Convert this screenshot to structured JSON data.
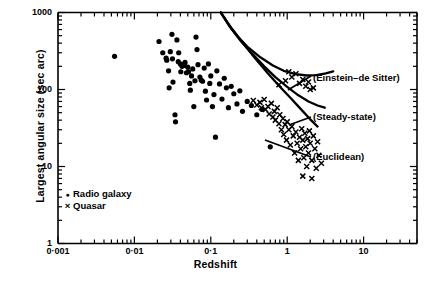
{
  "chart_data": {
    "type": "scatter",
    "title": "",
    "xlabel": "Redshift",
    "ylabel": "Largest angular size (sec arc)",
    "xscale": "log",
    "yscale": "log",
    "xlim": [
      0.001,
      50
    ],
    "ylim": [
      1,
      1000
    ],
    "grid": false,
    "xticklabels": [
      "0·001",
      "0·01",
      "0·1",
      "1",
      "10"
    ],
    "xtickvalues": [
      0.001,
      0.01,
      0.1,
      1,
      10
    ],
    "yticklabels": [
      "1000",
      "100",
      "10",
      "1"
    ],
    "ytickvalues": [
      1000,
      100,
      10,
      1
    ],
    "legend_position": "lower-left inside axes",
    "series": [
      {
        "name": "Radio galaxy",
        "marker": "filled-circle",
        "color": "#000000",
        "points": [
          [
            0.0055,
            270
          ],
          [
            0.021,
            420
          ],
          [
            0.0235,
            300
          ],
          [
            0.026,
            255
          ],
          [
            0.0265,
            240
          ],
          [
            0.028,
            175
          ],
          [
            0.0285,
            105
          ],
          [
            0.0295,
            310
          ],
          [
            0.031,
            520
          ],
          [
            0.0315,
            250
          ],
          [
            0.032,
            125
          ],
          [
            0.034,
            47
          ],
          [
            0.0345,
            38
          ],
          [
            0.036,
            440
          ],
          [
            0.0375,
            230
          ],
          [
            0.038,
            300
          ],
          [
            0.04,
            215
          ],
          [
            0.0405,
            170
          ],
          [
            0.042,
            200
          ],
          [
            0.044,
            210
          ],
          [
            0.045,
            205
          ],
          [
            0.046,
            225
          ],
          [
            0.048,
            165
          ],
          [
            0.05,
            195
          ],
          [
            0.051,
            170
          ],
          [
            0.053,
            120
          ],
          [
            0.054,
            98
          ],
          [
            0.056,
            150
          ],
          [
            0.058,
            185
          ],
          [
            0.06,
            60
          ],
          [
            0.062,
            130
          ],
          [
            0.064,
            480
          ],
          [
            0.066,
            330
          ],
          [
            0.068,
            210
          ],
          [
            0.072,
            145
          ],
          [
            0.075,
            132
          ],
          [
            0.078,
            128
          ],
          [
            0.082,
            190
          ],
          [
            0.085,
            95
          ],
          [
            0.088,
            73
          ],
          [
            0.093,
            215
          ],
          [
            0.097,
            120
          ],
          [
            0.1,
            150
          ],
          [
            0.105,
            60
          ],
          [
            0.11,
            86
          ],
          [
            0.115,
            24
          ],
          [
            0.12,
            175
          ],
          [
            0.13,
            118
          ],
          [
            0.14,
            75
          ],
          [
            0.15,
            140
          ],
          [
            0.16,
            105
          ],
          [
            0.17,
            58
          ],
          [
            0.185,
            110
          ],
          [
            0.2,
            88
          ],
          [
            0.22,
            65
          ],
          [
            0.24,
            96
          ],
          [
            0.26,
            52
          ],
          [
            0.3,
            70
          ],
          [
            0.34,
            62
          ],
          [
            0.4,
            47
          ],
          [
            0.47,
            55
          ],
          [
            0.6,
            18
          ]
        ]
      },
      {
        "name": "Quasar",
        "marker": "cross",
        "color": "#000000",
        "points": [
          [
            0.36,
            72
          ],
          [
            0.4,
            63
          ],
          [
            0.44,
            68
          ],
          [
            0.46,
            58
          ],
          [
            0.5,
            74
          ],
          [
            0.52,
            55
          ],
          [
            0.56,
            60
          ],
          [
            0.58,
            48
          ],
          [
            0.62,
            66
          ],
          [
            0.65,
            44
          ],
          [
            0.68,
            52
          ],
          [
            0.7,
            40
          ],
          [
            0.74,
            58
          ],
          [
            0.78,
            36
          ],
          [
            0.8,
            47
          ],
          [
            0.84,
            30
          ],
          [
            0.88,
            42
          ],
          [
            0.9,
            26
          ],
          [
            0.94,
            35
          ],
          [
            0.98,
            22
          ],
          [
            1.0,
            38
          ],
          [
            1.05,
            30
          ],
          [
            1.1,
            19
          ],
          [
            1.15,
            33
          ],
          [
            1.2,
            25
          ],
          [
            1.25,
            15
          ],
          [
            1.3,
            28
          ],
          [
            1.35,
            20
          ],
          [
            1.4,
            12
          ],
          [
            1.45,
            24
          ],
          [
            1.5,
            17
          ],
          [
            1.55,
            31
          ],
          [
            1.6,
            22
          ],
          [
            1.65,
            13
          ],
          [
            1.7,
            27
          ],
          [
            1.75,
            18
          ],
          [
            1.8,
            10
          ],
          [
            1.85,
            23
          ],
          [
            1.9,
            15
          ],
          [
            1.95,
            29
          ],
          [
            2.0,
            20
          ],
          [
            2.1,
            12
          ],
          [
            2.2,
            25
          ],
          [
            2.3,
            17
          ],
          [
            2.4,
            9.5
          ],
          [
            2.5,
            21
          ],
          [
            2.6,
            14
          ],
          [
            2.8,
            11
          ],
          [
            0.95,
            130
          ],
          [
            1.05,
            170
          ],
          [
            1.15,
            145
          ],
          [
            1.3,
            160
          ],
          [
            1.45,
            120
          ],
          [
            1.6,
            135
          ],
          [
            1.75,
            110
          ],
          [
            1.9,
            125
          ],
          [
            2.0,
            100
          ],
          [
            2.2,
            105
          ],
          [
            0.78,
            115
          ],
          [
            1.6,
            7.5
          ],
          [
            2.1,
            7.0
          ]
        ]
      }
    ],
    "curves": [
      {
        "name": "Einstein-de Sitter",
        "label": "(Einstein–de Sitter)",
        "points": [
          [
            0.135,
            1000
          ],
          [
            0.17,
            700
          ],
          [
            0.22,
            500
          ],
          [
            0.3,
            360
          ],
          [
            0.45,
            260
          ],
          [
            0.65,
            205
          ],
          [
            0.9,
            175
          ],
          [
            1.3,
            158
          ],
          [
            1.8,
            152
          ],
          [
            2.4,
            154
          ],
          [
            3.2,
            162
          ],
          [
            4.0,
            172
          ]
        ]
      },
      {
        "name": "Steady-state",
        "label": "(Steady-state)",
        "points": [
          [
            0.135,
            1000
          ],
          [
            0.18,
            640
          ],
          [
            0.25,
            420
          ],
          [
            0.35,
            290
          ],
          [
            0.5,
            200
          ],
          [
            0.7,
            145
          ],
          [
            1.0,
            108
          ],
          [
            1.4,
            84
          ],
          [
            1.9,
            70
          ],
          [
            2.5,
            62
          ],
          [
            3.1,
            58
          ]
        ]
      },
      {
        "name": "Euclidean",
        "label": "(Euclidean)",
        "points": [
          [
            0.135,
            1000
          ],
          [
            0.19,
            610
          ],
          [
            0.27,
            390
          ],
          [
            0.38,
            255
          ],
          [
            0.55,
            165
          ],
          [
            0.78,
            112
          ],
          [
            1.1,
            78
          ],
          [
            1.5,
            56
          ],
          [
            2.0,
            41
          ],
          [
            2.5,
            33
          ]
        ]
      }
    ],
    "annotations": [
      {
        "text": "(Einstein–de Sitter)",
        "x_px": 313,
        "y_px": 79
      },
      {
        "text": "(Steady-state)",
        "x_px": 313,
        "y_px": 118
      },
      {
        "text": "(Euclidean)",
        "x_px": 313,
        "y_px": 158
      }
    ]
  },
  "legend": {
    "items": [
      {
        "symbol": "●",
        "label": "Radio galaxy"
      },
      {
        "symbol": "×",
        "label": "Quasar"
      }
    ]
  }
}
